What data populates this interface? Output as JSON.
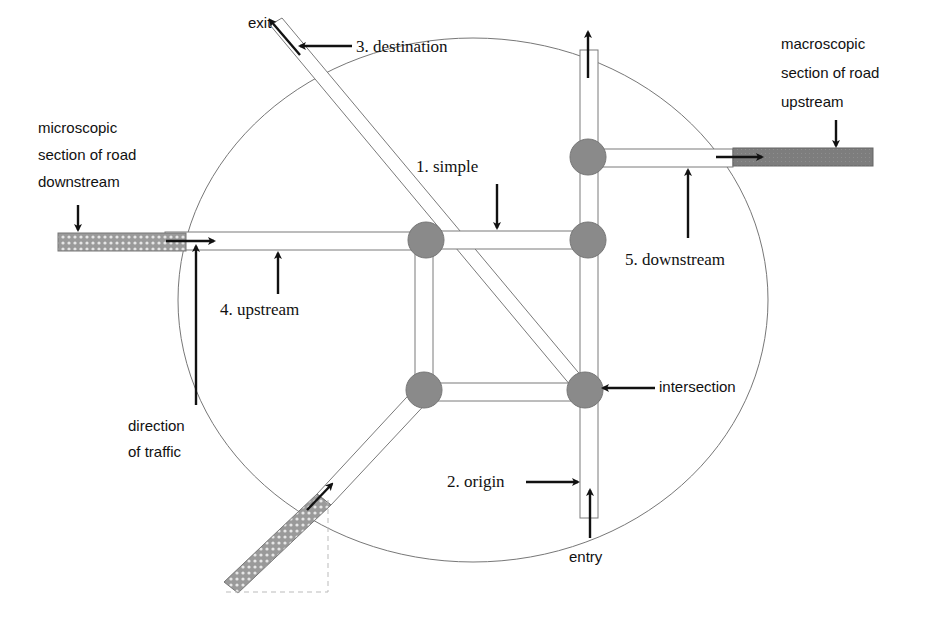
{
  "diagram": {
    "colors": {
      "background": "#ffffff",
      "node": "#8a8a8a",
      "road_outline": "#7a7a7a",
      "macroscopic_fill": "#7d7d7d",
      "microscopic_fill": "#9a9a9a",
      "arrow": "#111111"
    },
    "labels": {
      "exit": "exit",
      "destination": "3. destination",
      "simple": "1. simple",
      "upstream_section": "4. upstream",
      "downstream_section": "5. downstream",
      "intersection": "intersection",
      "origin": "2. origin",
      "entry": "entry",
      "direction_line1": "direction",
      "direction_line2": "of traffic",
      "micro_line1": "microscopic",
      "micro_line2": "section of road",
      "micro_line3": "downstream",
      "macro_line1": "macroscopic",
      "macro_line2": "section of road",
      "macro_line3": "upstream"
    },
    "legend_concepts": [
      "1. simple",
      "2. origin",
      "3. destination",
      "4. upstream",
      "5. downstream"
    ]
  }
}
